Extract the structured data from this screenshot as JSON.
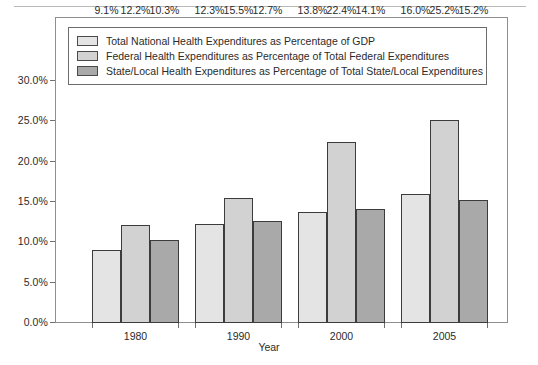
{
  "chart_data": {
    "type": "bar",
    "title": "",
    "xlabel": "Year",
    "ylabel": "",
    "categories": [
      "1980",
      "1990",
      "2000",
      "2005"
    ],
    "series": [
      {
        "name": "Total National Health Expenditures as Percentage of GDP",
        "color": "#e4e4e4",
        "values": [
          9.1,
          12.3,
          13.8,
          16.0
        ],
        "labels": [
          "9.1%",
          "12.3%",
          "13.8%",
          "16.0%"
        ]
      },
      {
        "name": "Federal Health Expenditures as Percentage of Total Federal Expenditures",
        "color": "#d2d2d2",
        "values": [
          12.2,
          15.5,
          22.4,
          25.2
        ],
        "labels": [
          "12.2%",
          "15.5%",
          "22.4%",
          "25.2%"
        ]
      },
      {
        "name": "State/Local Health Expenditures as Percentage of Total State/Local Expenditures",
        "color": "#a9a9a9",
        "values": [
          10.3,
          12.7,
          14.1,
          15.2
        ],
        "labels": [
          "10.3%",
          "12.7%",
          "14.1%",
          "15.2%"
        ]
      }
    ],
    "ylim": [
      0,
      30
    ],
    "ytick_values": [
      0,
      5,
      10,
      15,
      20,
      25,
      30
    ],
    "ytick_labels": [
      "0.0%",
      "5.0%",
      "10.0%",
      "15.0%",
      "20.0%",
      "25.0%",
      "30.0%"
    ],
    "grid": false,
    "legend_position": "top-inside"
  },
  "axis": {
    "x_title": "Year"
  },
  "legend": {
    "items": [
      {
        "label": "Total National Health Expenditures as Percentage of GDP",
        "color": "#e4e4e4"
      },
      {
        "label": "Federal Health Expenditures as Percentage of Total Federal Expenditures",
        "color": "#d2d2d2"
      },
      {
        "label": "State/Local Health Expenditures as Percentage of Total State/Local Expenditures",
        "color": "#a9a9a9"
      }
    ]
  }
}
